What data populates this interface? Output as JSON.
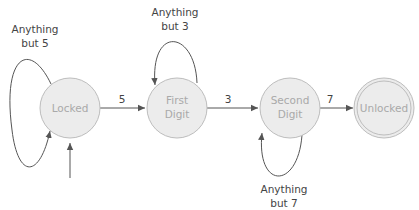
{
  "diagram": {
    "type": "finite-state-machine",
    "states": [
      {
        "id": "locked",
        "lines": [
          "Locked"
        ],
        "start": true,
        "accepting": false
      },
      {
        "id": "first",
        "lines": [
          "First",
          "Digit"
        ],
        "start": false,
        "accepting": false
      },
      {
        "id": "second",
        "lines": [
          "Second",
          "Digit"
        ],
        "start": false,
        "accepting": false
      },
      {
        "id": "unlocked",
        "lines": [
          "Unlocked"
        ],
        "start": false,
        "accepting": true
      }
    ],
    "transitions": [
      {
        "from": "locked",
        "to": "locked",
        "label": [
          "Anything",
          "but 5"
        ]
      },
      {
        "from": "locked",
        "to": "first",
        "label": [
          "5"
        ]
      },
      {
        "from": "first",
        "to": "first",
        "label": [
          "Anything",
          "but 3"
        ]
      },
      {
        "from": "first",
        "to": "second",
        "label": [
          "3"
        ]
      },
      {
        "from": "second",
        "to": "second",
        "label": [
          "Anything",
          "but 7"
        ]
      },
      {
        "from": "second",
        "to": "unlocked",
        "label": [
          "7"
        ]
      }
    ],
    "colors": {
      "state_fill": "#ececec",
      "state_stroke": "#bdbdbd",
      "state_text": "#a9a9a9",
      "edge": "#555555",
      "edge_text": "#444444"
    }
  }
}
